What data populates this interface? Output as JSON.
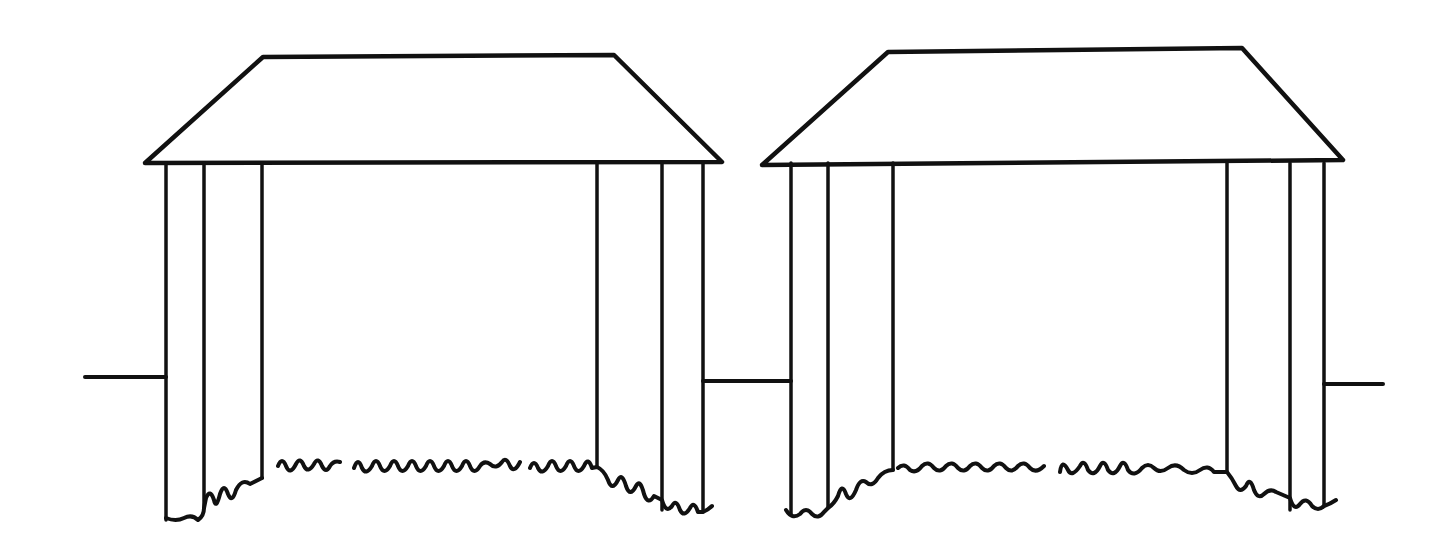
{
  "diagram": {
    "stroke_color": "#111111",
    "background": "#ffffff",
    "connector_lines": [
      {
        "x1": 85,
        "y1": 377,
        "x2": 166,
        "y2": 377
      },
      {
        "x1": 703,
        "y1": 381,
        "x2": 791,
        "y2": 381
      },
      {
        "x1": 1324,
        "y1": 384,
        "x2": 1383,
        "y2": 384
      }
    ],
    "structures": [
      {
        "name": "left-stage",
        "roof": [
          [
            263,
            57
          ],
          [
            614,
            55
          ],
          [
            722,
            162
          ],
          [
            145,
            163
          ]
        ],
        "column_top": 163,
        "columns": [
          {
            "x": 166,
            "bottom": 520
          },
          {
            "x": 204,
            "bottom": 508
          },
          {
            "x": 262,
            "bottom": 478
          },
          {
            "x": 597,
            "bottom": 467
          },
          {
            "x": 662,
            "bottom": 510
          },
          {
            "x": 703,
            "bottom": 512
          }
        ],
        "hem": "M166,518 Q176,522 184,518 Q192,514 198,520 Q204,516 204,508 L206,498 Q210,488 214,500 Q216,510 220,494 Q224,482 228,494 Q232,504 236,490 Q242,478 250,484 L262,478 M278,466 Q282,456 286,466 Q290,476 296,464 Q300,456 304,466 Q308,474 314,464 Q318,456 322,466 Q326,474 330,466 Q334,460 340,462 M354,468 Q358,456 362,468 Q366,476 372,466 Q376,456 380,466 Q384,476 390,466 Q394,456 398,466 Q402,476 408,466 Q412,456 416,466 Q420,476 426,466 Q430,456 434,466 Q438,476 444,466 Q448,456 452,466 Q456,476 462,466 Q466,456 470,466 Q474,476 480,466 Q484,460 490,464 Q496,470 502,462 Q506,456 510,466 Q514,474 520,462 M530,468 Q534,458 538,468 Q542,476 548,466 Q552,456 556,466 Q560,476 566,466 Q570,456 574,466 Q578,476 584,466 Q588,456 592,468 L597,467 Q604,470 608,480 Q612,492 618,480 Q622,472 626,486 Q630,498 636,486 Q640,478 644,494 Q648,506 654,496 L662,500 Q666,514 672,506 Q676,498 680,510 Q684,518 690,508 Q694,500 698,512 L703,512 Q708,510 712,506"
      },
      {
        "name": "right-stage",
        "roof": [
          [
            888,
            52
          ],
          [
            1242,
            48
          ],
          [
            1343,
            160
          ],
          [
            762,
            165
          ]
        ],
        "column_top": 163,
        "columns": [
          {
            "x": 791,
            "bottom": 514
          },
          {
            "x": 828,
            "bottom": 508
          },
          {
            "x": 893,
            "bottom": 470
          },
          {
            "x": 1227,
            "bottom": 472
          },
          {
            "x": 1290,
            "bottom": 510
          },
          {
            "x": 1324,
            "bottom": 506
          }
        ],
        "hem": "M786,510 Q792,520 800,514 Q806,506 812,514 Q818,520 824,512 L828,508 Q834,504 838,496 Q842,482 846,494 Q850,504 856,490 Q860,478 866,482 Q872,488 878,478 Q884,470 893,470 M898,468 Q904,462 910,470 Q916,474 922,466 Q928,460 934,468 Q940,474 946,466 Q952,460 958,468 Q964,474 970,466 Q976,460 982,468 Q988,474 994,466 Q1000,460 1006,468 Q1012,474 1018,466 Q1024,460 1030,468 Q1036,474 1044,466 M1060,472 Q1062,458 1068,470 Q1072,478 1080,466 Q1084,458 1088,470 Q1094,478 1100,466 Q1104,458 1108,470 Q1114,478 1120,466 Q1124,458 1128,470 Q1134,478 1142,468 Q1148,462 1154,468 Q1160,474 1168,468 Q1176,462 1184,470 Q1192,476 1200,470 Q1208,464 1214,472 L1227,472 Q1232,478 1236,486 Q1240,494 1246,486 Q1250,476 1254,490 Q1258,500 1264,494 Q1270,488 1276,492 L1290,498 Q1294,512 1300,504 Q1306,496 1312,506 Q1318,512 1324,506 Q1330,504 1336,500"
      }
    ]
  }
}
